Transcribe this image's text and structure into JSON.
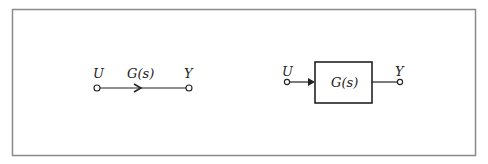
{
  "figure": {
    "frame_color": "#8a8a8a",
    "stroke_color": "#222222"
  },
  "signal_flow_graph": {
    "input_label": "U",
    "branch_label": "G(s)",
    "output_label": "Y"
  },
  "block_diagram": {
    "input_label": "U",
    "block_label": "G(s)",
    "output_label": "Y"
  }
}
